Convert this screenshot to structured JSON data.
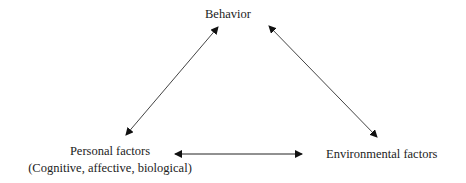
{
  "diagram": {
    "type": "triangle-reciprocal-determinism",
    "nodes": {
      "behavior": {
        "label": "Behavior"
      },
      "personal": {
        "label": "Personal factors",
        "sublabel": "(Cognitive, affective, biological)"
      },
      "environmental": {
        "label": "Environmental factors"
      }
    },
    "edges": [
      {
        "from": "personal",
        "to": "behavior",
        "bidirectional": true
      },
      {
        "from": "behavior",
        "to": "environmental",
        "bidirectional": true
      },
      {
        "from": "personal",
        "to": "environmental",
        "bidirectional": true
      }
    ],
    "colors": {
      "text": "#222222",
      "line": "#333333"
    }
  }
}
